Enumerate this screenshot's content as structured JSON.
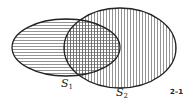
{
  "diagram": {
    "type": "venn",
    "sets": [
      {
        "name": "S",
        "subscript": "1",
        "hatch": "horizontal"
      },
      {
        "name": "S",
        "subscript": "2",
        "hatch": "vertical"
      }
    ],
    "figure_label": "2–1",
    "colors": {
      "stroke": "#222222",
      "hatch": "#555555",
      "background": "#ffffff"
    }
  }
}
